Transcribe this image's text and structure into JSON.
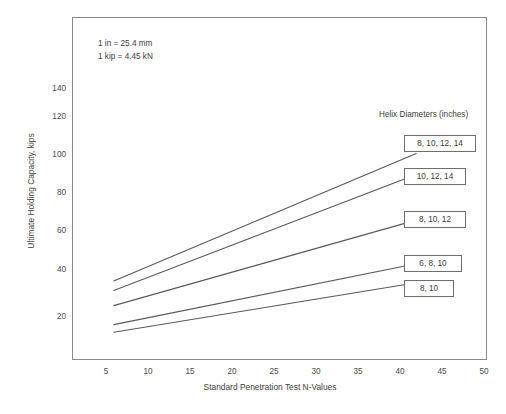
{
  "chart_data": {
    "type": "line",
    "title": "",
    "xlabel": "Standard Penetration Test N-Values",
    "ylabel": "Ultimate Holding Capacity, kips",
    "xlim": [
      0,
      53.5
    ],
    "ylim": [
      0,
      150
    ],
    "xticks": [
      5,
      10,
      15,
      20,
      25,
      30,
      35,
      40,
      45,
      50
    ],
    "yticks": [
      20,
      40,
      60,
      80,
      100,
      120,
      140
    ],
    "grid": false,
    "legend_position": "right-inside",
    "legend_title": "Helix Diameters (inches)",
    "annotations": [
      "1 in = 25.4 mm",
      "1 kip = 4.45 kN"
    ],
    "x": [
      6,
      45
    ],
    "series": [
      {
        "name": "8, 10, 12, 14",
        "values": [
          39,
          106
        ]
      },
      {
        "name": "10, 12, 14",
        "values": [
          34,
          95
        ]
      },
      {
        "name": "8, 10, 12",
        "values": [
          26,
          71
        ]
      },
      {
        "name": "6, 8, 10",
        "values": [
          16,
          48
        ]
      },
      {
        "name": "8, 10",
        "values": [
          12,
          38
        ]
      }
    ]
  },
  "notes": {
    "line1": "1 in = 25.4 mm",
    "line2": "1 kip = 4.45 kN"
  },
  "axes": {
    "y_title": "Ultimate Holding Capacity, kips",
    "x_title": "Standard Penetration Test N-Values",
    "y_ticks": [
      "140",
      "120",
      "100",
      "80",
      "60",
      "40",
      "20"
    ],
    "x_ticks": [
      "5",
      "10",
      "15",
      "20",
      "25",
      "30",
      "35",
      "40",
      "45",
      "50"
    ]
  },
  "legend": {
    "title": "Helix Diameters (inches)",
    "items": [
      {
        "label": "8, 10, 12, 14"
      },
      {
        "label": "10, 12, 14"
      },
      {
        "label": "8, 10, 12"
      },
      {
        "label": "6, 8, 10"
      },
      {
        "label": "8, 10"
      }
    ]
  },
  "colors": {
    "line": "#595959",
    "frame": "#8a8a8a",
    "text": "#3d3d3d",
    "background": "#ffffff"
  }
}
